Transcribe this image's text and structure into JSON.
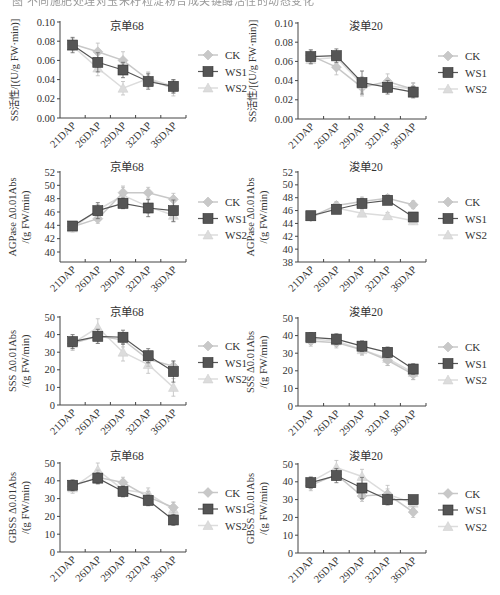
{
  "caption": "图 不同施肥处理对玉米籽粒淀粉合成关键酶活性的动态变化",
  "legend": [
    {
      "name": "CK",
      "color": "#c8c8c8",
      "marker": "diamond"
    },
    {
      "name": "WS1",
      "color": "#555555",
      "marker": "square"
    },
    {
      "name": "WS2",
      "color": "#dcdcdc",
      "marker": "triangle"
    }
  ],
  "chart_data": [
    {
      "type": "line",
      "title": "京单68",
      "ylabel": [
        "SS活性/[(U/g FW·min)]"
      ],
      "categories": [
        "21DAP",
        "26DAP",
        "29DAP",
        "32DAP",
        "36DAP"
      ],
      "ylim": [
        0,
        0.1
      ],
      "yticks": [
        0.0,
        0.02,
        0.04,
        0.06,
        0.08,
        0.1
      ],
      "ytick_labels": [
        "0.00",
        "0.02",
        "0.04",
        "0.06",
        "0.08",
        "0.10"
      ],
      "series": [
        {
          "name": "CK",
          "values": [
            0.077,
            0.069,
            0.06,
            0.04,
            0.031
          ],
          "errors": [
            0.006,
            0.009,
            0.009,
            0.008,
            0.008
          ]
        },
        {
          "name": "WS1",
          "values": [
            0.076,
            0.058,
            0.05,
            0.038,
            0.033
          ],
          "errors": [
            0.008,
            0.01,
            0.008,
            0.008,
            0.007
          ]
        },
        {
          "name": "WS2",
          "values": [
            0.075,
            0.052,
            0.031,
            0.041,
            0.033
          ],
          "errors": [
            0.005,
            0.008,
            0.007,
            0.006,
            0.007
          ]
        }
      ],
      "grid": false,
      "legend_position": "right"
    },
    {
      "type": "line",
      "title": "浚单20",
      "ylabel": [
        "SS活性/[(U/g FW·min)]"
      ],
      "categories": [
        "21DAP",
        "26DAP",
        "29DAP",
        "32DAP",
        "36DAP"
      ],
      "ylim": [
        0,
        0.1
      ],
      "yticks": [
        0.0,
        0.02,
        0.04,
        0.06,
        0.08,
        0.1
      ],
      "ytick_labels": [
        "0.00",
        "0.02",
        "0.04",
        "0.06",
        "0.08",
        "0.10"
      ],
      "series": [
        {
          "name": "CK",
          "values": [
            0.066,
            0.054,
            0.033,
            0.039,
            0.031
          ],
          "errors": [
            0.006,
            0.008,
            0.009,
            0.008,
            0.007
          ]
        },
        {
          "name": "WS1",
          "values": [
            0.065,
            0.066,
            0.038,
            0.033,
            0.028
          ],
          "errors": [
            0.007,
            0.007,
            0.012,
            0.007,
            0.006
          ]
        },
        {
          "name": "WS2",
          "values": [
            0.062,
            0.064,
            0.036,
            0.035,
            0.031
          ],
          "errors": [
            0.005,
            0.006,
            0.008,
            0.006,
            0.006
          ]
        }
      ],
      "grid": false,
      "legend_position": "right"
    },
    {
      "type": "line",
      "title": "京单68",
      "ylabel": [
        "AGPase Δ0.01Abs",
        "/(g FW/min)"
      ],
      "categories": [
        "21DAP",
        "26DAP",
        "29DAP",
        "32DAP",
        "36DAP"
      ],
      "ylim": [
        38.5,
        52
      ],
      "yticks": [
        40,
        42,
        44,
        46,
        48,
        50,
        52
      ],
      "ytick_labels": [
        "40",
        "42",
        "44",
        "46",
        "48",
        "50",
        "52"
      ],
      "series": [
        {
          "name": "CK",
          "values": [
            43.8,
            45.0,
            48.9,
            48.9,
            47.9
          ],
          "errors": [
            0.5,
            0.7,
            1.0,
            0.8,
            0.9
          ]
        },
        {
          "name": "WS1",
          "values": [
            43.9,
            46.2,
            47.3,
            46.6,
            46.2
          ],
          "errors": [
            0.5,
            1.2,
            0.8,
            1.3,
            1.6
          ]
        },
        {
          "name": "WS2",
          "values": [
            43.6,
            46.3,
            48.5,
            46.8,
            45.5
          ],
          "errors": [
            0.6,
            0.8,
            1.2,
            1.0,
            1.0
          ]
        }
      ],
      "grid": false,
      "legend_position": "right"
    },
    {
      "type": "line",
      "title": "浚单20",
      "ylabel": [
        "AGPase Δ0.01Abs",
        "/(g FW/min)"
      ],
      "categories": [
        "21DAP",
        "26DAP",
        "29DAP",
        "32DAP",
        "36DAP"
      ],
      "ylim": [
        38,
        52
      ],
      "yticks": [
        38,
        40,
        42,
        44,
        46,
        48,
        50,
        52
      ],
      "ytick_labels": [
        "38",
        "40",
        "42",
        "44",
        "46",
        "48",
        "50",
        "52"
      ],
      "series": [
        {
          "name": "CK",
          "values": [
            45.0,
            46.8,
            47.4,
            47.9,
            46.9
          ],
          "errors": [
            0.4,
            0.6,
            0.7,
            0.6,
            0.6
          ]
        },
        {
          "name": "WS1",
          "values": [
            45.2,
            46.2,
            47.1,
            47.6,
            45.0
          ],
          "errors": [
            0.4,
            0.5,
            0.7,
            0.6,
            0.7
          ]
        },
        {
          "name": "WS2",
          "values": [
            45.0,
            46.4,
            45.6,
            45.2,
            44.4
          ],
          "errors": [
            0.4,
            0.6,
            0.5,
            0.5,
            0.5
          ]
        }
      ],
      "grid": false,
      "legend_position": "right"
    },
    {
      "type": "line",
      "title": "京单68",
      "ylabel": [
        "SSS Δ0.01Abs",
        "/(g FW/min)"
      ],
      "categories": [
        "21DAP",
        "26DAP",
        "29DAP",
        "32DAP",
        "36DAP"
      ],
      "ylim": [
        0,
        50
      ],
      "yticks": [
        0,
        10,
        20,
        30,
        40,
        50
      ],
      "ytick_labels": [
        "0",
        "10",
        "20",
        "30",
        "40",
        "50"
      ],
      "series": [
        {
          "name": "CK",
          "values": [
            35,
            39,
            37,
            26,
            22
          ],
          "errors": [
            4,
            4,
            4,
            4,
            3
          ]
        },
        {
          "name": "WS1",
          "values": [
            36,
            39,
            38.5,
            28,
            19
          ],
          "errors": [
            4,
            4,
            4,
            4,
            6
          ]
        },
        {
          "name": "WS2",
          "values": [
            35,
            44,
            30,
            23,
            10
          ],
          "errors": [
            3,
            5,
            5,
            5,
            5
          ]
        }
      ],
      "grid": false,
      "legend_position": "right"
    },
    {
      "type": "line",
      "title": "浚单20",
      "ylabel": [
        "SSS Δ0.01Abs",
        "/(g FW/min)"
      ],
      "categories": [
        "21DAP",
        "26DAP",
        "29DAP",
        "32DAP",
        "36DAP"
      ],
      "ylim": [
        0,
        50
      ],
      "yticks": [
        0,
        10,
        20,
        30,
        40,
        50
      ],
      "ytick_labels": [
        "0",
        "10",
        "20",
        "30",
        "40",
        "50"
      ],
      "series": [
        {
          "name": "CK",
          "values": [
            37,
            36,
            32,
            26,
            18
          ],
          "errors": [
            3,
            3,
            3,
            3,
            3
          ]
        },
        {
          "name": "WS1",
          "values": [
            39,
            38,
            34,
            30.5,
            21
          ],
          "errors": [
            2.5,
            3,
            3,
            3,
            3
          ]
        },
        {
          "name": "WS2",
          "values": [
            38,
            37,
            32,
            27,
            19
          ],
          "errors": [
            3,
            3,
            3,
            4,
            4
          ]
        }
      ],
      "grid": false,
      "legend_position": "right"
    },
    {
      "type": "line",
      "title": "京单68",
      "ylabel": [
        "GBSS Δ0.01Abs",
        "/(g FW/min)"
      ],
      "categories": [
        "21DAP",
        "26DAP",
        "29DAP",
        "32DAP",
        "36DAP"
      ],
      "ylim": [
        0,
        50
      ],
      "yticks": [
        0,
        10,
        20,
        30,
        40,
        50
      ],
      "ytick_labels": [
        "0",
        "10",
        "20",
        "30",
        "40",
        "50"
      ],
      "series": [
        {
          "name": "CK",
          "values": [
            37,
            42,
            39,
            31,
            25
          ],
          "errors": [
            3,
            4,
            3,
            3,
            3
          ]
        },
        {
          "name": "WS1",
          "values": [
            37.5,
            41.5,
            34,
            29,
            18
          ],
          "errors": [
            3,
            3,
            3,
            3,
            3
          ]
        },
        {
          "name": "WS2",
          "values": [
            36,
            46,
            35,
            33,
            24
          ],
          "errors": [
            3,
            4,
            3,
            3,
            4
          ]
        }
      ],
      "grid": false,
      "legend_position": "right"
    },
    {
      "type": "line",
      "title": "浚单20",
      "ylabel": [
        "GBSS Δ0.01Abs",
        "/(g FW/min)"
      ],
      "categories": [
        "21DAP",
        "26DAP",
        "29DAP",
        "32DAP",
        "36DAP"
      ],
      "ylim": [
        0,
        50
      ],
      "yticks": [
        0,
        10,
        20,
        30,
        40,
        50
      ],
      "ytick_labels": [
        "0",
        "10",
        "20",
        "30",
        "40",
        "50"
      ],
      "series": [
        {
          "name": "CK",
          "values": [
            38,
            44,
            32,
            33,
            23
          ],
          "errors": [
            3,
            3,
            3,
            3,
            3
          ]
        },
        {
          "name": "WS1",
          "values": [
            39.5,
            43.5,
            36.5,
            30,
            30
          ],
          "errors": [
            3,
            4,
            6,
            3,
            2
          ]
        },
        {
          "name": "WS2",
          "values": [
            40,
            48,
            43,
            33,
            28
          ],
          "errors": [
            3,
            4,
            4,
            5,
            3
          ]
        }
      ],
      "grid": false,
      "legend_position": "right"
    }
  ]
}
